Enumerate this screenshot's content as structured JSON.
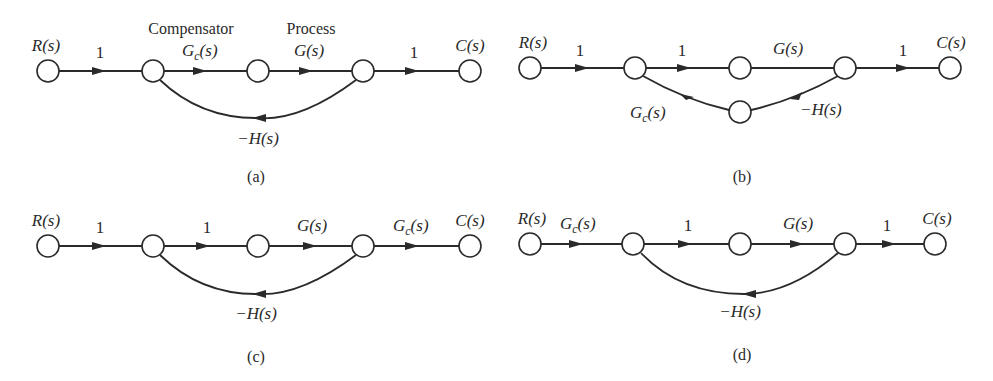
{
  "figure": {
    "panels": [
      {
        "id": "a",
        "caption": "(a)",
        "headers": {
          "compensator": "Compensator",
          "process": "Process"
        },
        "input_label": "R(s)",
        "output_label": "C(s)",
        "forward_gains": [
          "1",
          "Gc(s)",
          "G(s)",
          "1"
        ],
        "feedback_gain": "−H(s)",
        "gc": {
          "main": "G",
          "sub": "c",
          "tail": "(s)"
        }
      },
      {
        "id": "b",
        "caption": "(b)",
        "input_label": "R(s)",
        "output_label": "C(s)",
        "forward_gains": [
          "1",
          "1",
          "G(s)",
          "1"
        ],
        "feedback_gains": [
          "−H(s)",
          "Gc(s)"
        ],
        "gc": {
          "main": "G",
          "sub": "c",
          "tail": "(s)"
        },
        "h_label": "−H(s)"
      },
      {
        "id": "c",
        "caption": "(c)",
        "input_label": "R(s)",
        "output_label": "C(s)",
        "forward_gains": [
          "1",
          "1",
          "G(s)",
          "Gc(s)"
        ],
        "feedback_gain": "−H(s)",
        "gc": {
          "main": "G",
          "sub": "c",
          "tail": "(s)"
        }
      },
      {
        "id": "d",
        "caption": "(d)",
        "input_label": "R(s)",
        "output_label": "C(s)",
        "forward_gains": [
          "Gc(s)",
          "1",
          "G(s)",
          "1"
        ],
        "feedback_gain": "−H(s)",
        "gc": {
          "main": "G",
          "sub": "c",
          "tail": "(s)"
        }
      }
    ],
    "labels": {
      "one": "1",
      "g": "G(s)",
      "neg_h": "−H(s)",
      "r": "R(s)",
      "c": "C(s)"
    }
  }
}
